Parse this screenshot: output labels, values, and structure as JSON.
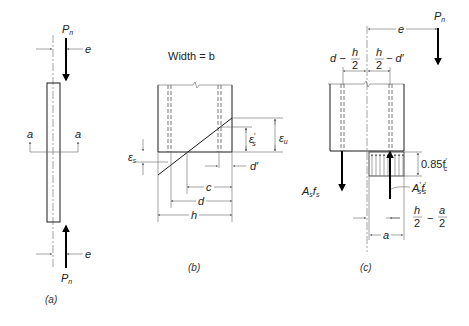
{
  "figure": {
    "panels": [
      {
        "id": "a",
        "caption": "(a)",
        "labels": {
          "load_top": "P",
          "load_top_sub": "n",
          "load_bottom": "P",
          "load_bottom_sub": "n",
          "ecc_top": "e",
          "ecc_bottom": "e",
          "section_left": "a",
          "section_right": "a"
        }
      },
      {
        "id": "b",
        "caption": "(b)",
        "labels": {
          "title": "Width = b",
          "eps_s": "ε",
          "eps_s_sub": "s",
          "eps_s_prime": "ε",
          "eps_s_prime_sub": "s",
          "eps_s_prime_mark": "′",
          "eps_u": "ε",
          "eps_u_sub": "u",
          "d_prime": "d′",
          "c": "c",
          "d": "d",
          "h": "h"
        }
      },
      {
        "id": "c",
        "caption": "(c)",
        "labels": {
          "load": "P",
          "load_sub": "n",
          "e": "e",
          "d_minus": "d −",
          "h_num": "h",
          "two_den": "2",
          "h2_num": "h",
          "h2_den": "2",
          "minus_dprime": "− d′",
          "stress": "0.85f",
          "stress_sub": "c",
          "stress_prime": "′",
          "As": "A",
          "As_sub": "s",
          "fs": "f",
          "fs_sub": "s",
          "Asp": "A",
          "Asp_sub": "s",
          "Asp_prime": "′",
          "fsp": "f",
          "fsp_sub": "s",
          "fsp_prime": "′",
          "h_over_2": "h",
          "h_over_2_den": "2",
          "minus": "−",
          "a_over_2": "a",
          "a_over_2_den": "2",
          "a": "a"
        }
      }
    ]
  }
}
